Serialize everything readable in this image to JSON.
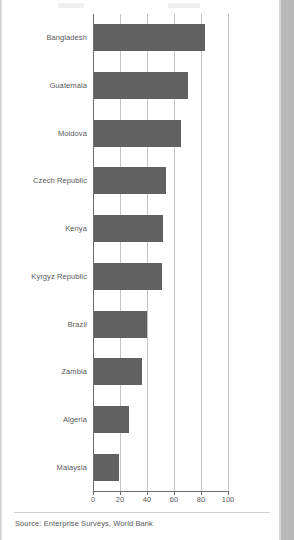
{
  "footer": {
    "source": "Source: Enterprise Surveys, World Bank"
  },
  "colors": {
    "bar": "#616161",
    "gridline": "#c4c4c4",
    "axis": "#6f6f6f",
    "text": "#58585a",
    "background": "#ffffff"
  },
  "chart_data": {
    "type": "bar",
    "orientation": "horizontal",
    "title": "",
    "xlabel": "",
    "ylabel": "",
    "xlim": [
      0,
      100
    ],
    "xticks": [
      0,
      20,
      40,
      60,
      80,
      100
    ],
    "xtick_labels": [
      "0",
      "20",
      "40",
      "60",
      "80",
      "100"
    ],
    "grid": true,
    "grid_axis": "x",
    "legend": false,
    "categories": [
      "Bangladesh",
      "Guatemala",
      "Moldova",
      "Czech Republic",
      "Kenya",
      "Kyrgyz Republic",
      "Brazil",
      "Zambia",
      "Algeria",
      "Malaysia"
    ],
    "values": [
      83,
      70,
      65,
      54,
      52,
      51,
      40,
      36,
      27,
      19.5
    ]
  }
}
